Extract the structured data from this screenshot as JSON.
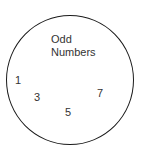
{
  "set": {
    "label_line1": "Odd",
    "label_line2": "Numbers",
    "elements": [
      "1",
      "3",
      "5",
      "7"
    ]
  },
  "colors": {
    "stroke": "#1a1a1a",
    "text": "#333333",
    "background": "#ffffff"
  }
}
